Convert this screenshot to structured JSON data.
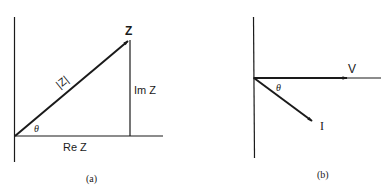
{
  "figure": {
    "panel_a": {
      "caption": "(a)",
      "vector_label": "Z",
      "magnitude_label": "|Z|",
      "imag_label": "Im Z",
      "real_label": "Re Z",
      "angle_label": "θ"
    },
    "panel_b": {
      "caption": "(b)",
      "voltage_label": "V",
      "current_label": "I",
      "angle_label": "θ"
    }
  },
  "colors": {
    "ink": "#1a1a1a",
    "background": "#ffffff"
  }
}
